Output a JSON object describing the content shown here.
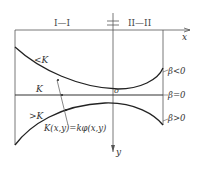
{
  "diagram": {
    "section_labels": {
      "left": "I—I",
      "right": "II—II"
    },
    "axes": {
      "x": "x",
      "y": "y",
      "origin": "o"
    },
    "region_labels": {
      "upper": "<K",
      "middle": "K",
      "lower": ">K"
    },
    "curve_labels": {
      "beta_neg": "β<0",
      "beta_zero": "β=0",
      "beta_pos": "β>0"
    },
    "equation": "K(x,y)=kφ(x,y)",
    "colors": {
      "line": "#333333",
      "text": "#444444"
    }
  }
}
